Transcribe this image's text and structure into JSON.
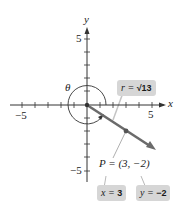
{
  "figure": {
    "axes": {
      "x_label": "x",
      "y_label": "y",
      "x_ticks": {
        "min": -5,
        "max": 5,
        "step": 1
      },
      "y_ticks": {
        "min": -5,
        "max": 5,
        "step": 1
      },
      "x_tick_labels": {
        "neg": "−5",
        "pos": "5"
      },
      "y_tick_labels": {
        "neg": "−5",
        "pos": "5"
      }
    },
    "angle": {
      "label": "θ"
    },
    "point": {
      "label": "P = (3, −2)",
      "x": 3,
      "y": -2
    },
    "callouts": {
      "r": {
        "prefix": "r = ",
        "value": "√13"
      },
      "x": {
        "prefix": "x = ",
        "value": "3"
      },
      "y": {
        "prefix": "y = ",
        "value": "−2"
      }
    },
    "colors": {
      "axis": "#333333",
      "vector": "#6b6b6b",
      "callout_bg": "#d6d6d6",
      "leader": "#b8b8b8"
    }
  }
}
